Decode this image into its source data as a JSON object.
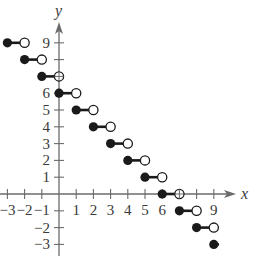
{
  "chart_data": {
    "type": "step",
    "title": "",
    "function": "f(x) = 6 - [[x]]",
    "xlabel": "x",
    "ylabel": "y",
    "xlim": [
      -3.4,
      10.3
    ],
    "ylim": [
      -3.8,
      10.8
    ],
    "x_tick_labels": [
      "-3",
      "-2",
      "-1",
      "1",
      "2",
      "3",
      "4",
      "5",
      "6",
      "9"
    ],
    "x_ticks": [
      -3,
      -2,
      -1,
      1,
      2,
      3,
      4,
      5,
      6,
      7,
      8,
      9
    ],
    "y_tick_labels": [
      "9",
      "6",
      "5",
      "4",
      "3",
      "2",
      "1",
      "-2",
      "-3"
    ],
    "y_ticks": [
      -3,
      -2,
      -1,
      1,
      2,
      3,
      4,
      5,
      6,
      7,
      8,
      9
    ],
    "grid": false,
    "segments": [
      {
        "x_start": -3,
        "x_end": -2,
        "y": 9,
        "start": "closed",
        "end": "open"
      },
      {
        "x_start": -2,
        "x_end": -1,
        "y": 8,
        "start": "closed",
        "end": "open"
      },
      {
        "x_start": -1,
        "x_end": 0,
        "y": 7,
        "start": "closed",
        "end": "open"
      },
      {
        "x_start": 0,
        "x_end": 1,
        "y": 6,
        "start": "closed",
        "end": "open"
      },
      {
        "x_start": 1,
        "x_end": 2,
        "y": 5,
        "start": "closed",
        "end": "open"
      },
      {
        "x_start": 2,
        "x_end": 3,
        "y": 4,
        "start": "closed",
        "end": "open"
      },
      {
        "x_start": 3,
        "x_end": 4,
        "y": 3,
        "start": "closed",
        "end": "open"
      },
      {
        "x_start": 4,
        "x_end": 5,
        "y": 2,
        "start": "closed",
        "end": "open"
      },
      {
        "x_start": 5,
        "x_end": 6,
        "y": 1,
        "start": "closed",
        "end": "open"
      },
      {
        "x_start": 6,
        "x_end": 7,
        "y": 0,
        "start": "closed",
        "end": "open"
      },
      {
        "x_start": 7,
        "x_end": 8,
        "y": -1,
        "start": "closed",
        "end": "open"
      },
      {
        "x_start": 8,
        "x_end": 9,
        "y": -2,
        "start": "closed",
        "end": "open"
      },
      {
        "x_start": 9,
        "x_end": 9.3,
        "y": -3,
        "start": "closed",
        "end": "continues"
      }
    ],
    "colors": {
      "ink": "#1a1a1a",
      "axis": "#6b6b6b",
      "text": "#3a3a3a"
    }
  }
}
